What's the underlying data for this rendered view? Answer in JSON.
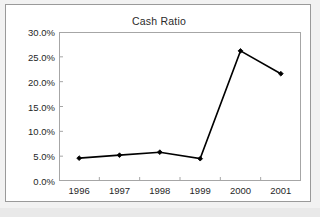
{
  "chart_data": {
    "type": "line",
    "title": "Cash Ratio",
    "xlabel": "",
    "ylabel": "",
    "categories": [
      "1996",
      "1997",
      "1998",
      "1999",
      "2000",
      "2001"
    ],
    "values": [
      4.6,
      5.2,
      5.8,
      4.5,
      26.2,
      21.6
    ],
    "value_format": "percent",
    "ylim": [
      0.0,
      30.0
    ],
    "ytick_values": [
      0.0,
      5.0,
      10.0,
      15.0,
      20.0,
      25.0,
      30.0
    ],
    "ytick_labels": [
      "0.0%",
      "5.0%",
      "10.0%",
      "15.0%",
      "20.0%",
      "25.0%",
      "30.0%"
    ],
    "xtick_labels": [
      "1996",
      "1997",
      "1998",
      "1999",
      "2000",
      "2001"
    ],
    "grid": false,
    "legend": null,
    "legend_position": "none",
    "series": [
      {
        "name": "Cash Ratio",
        "values": [
          4.6,
          5.2,
          5.8,
          4.5,
          26.2,
          21.6
        ],
        "marker": "diamond",
        "line_color": "#000000",
        "marker_color": "#000000"
      }
    ],
    "colors": {
      "line": "#000000",
      "marker": "#000000",
      "axis": "#a6a6a6",
      "frame": "#9a9a9a",
      "plot_background": "#ffffff",
      "page_background": "#f2f2f2",
      "text": "#1f1f1f"
    }
  },
  "figure": {
    "title": "Cash Ratio"
  }
}
